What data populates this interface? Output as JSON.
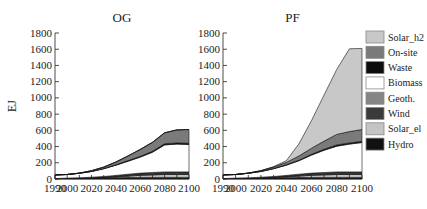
{
  "chart_data": [
    {
      "type": "area",
      "title": "OG",
      "xlabel": "",
      "ylabel": "EJ",
      "ylim": [
        0,
        1800
      ],
      "xlim": [
        1990,
        2100
      ],
      "x_ticks": [
        1990,
        2000,
        2020,
        2040,
        2060,
        2080,
        2100
      ],
      "y_ticks": [
        0,
        200,
        400,
        600,
        800,
        1000,
        1200,
        1400,
        1600,
        1800
      ],
      "stacked": true,
      "x": [
        1990,
        2000,
        2010,
        2020,
        2030,
        2040,
        2050,
        2060,
        2070,
        2080,
        2090,
        2100
      ],
      "series": [
        {
          "name": "Hydro",
          "values": [
            5,
            8,
            10,
            12,
            14,
            16,
            18,
            20,
            20,
            20,
            20,
            20
          ]
        },
        {
          "name": "Solar_el",
          "values": [
            0,
            0,
            0,
            1,
            4,
            10,
            18,
            25,
            30,
            35,
            35,
            35
          ]
        },
        {
          "name": "Wind",
          "values": [
            0,
            1,
            2,
            5,
            8,
            12,
            16,
            20,
            22,
            24,
            25,
            25
          ]
        },
        {
          "name": "Geoth.",
          "values": [
            1,
            2,
            3,
            4,
            5,
            6,
            7,
            8,
            8,
            8,
            8,
            8
          ]
        },
        {
          "name": "Biomass",
          "values": [
            44,
            45,
            55,
            70,
            95,
            126,
            161,
            197,
            250,
            333,
            342,
            337
          ]
        },
        {
          "name": "Waste",
          "values": [
            0,
            0,
            1,
            2,
            3,
            5,
            7,
            10,
            12,
            15,
            15,
            15
          ]
        },
        {
          "name": "On-site",
          "values": [
            0,
            0,
            2,
            8,
            18,
            35,
            58,
            85,
            110,
            135,
            160,
            170
          ]
        },
        {
          "name": "Solar_h2",
          "values": [
            0,
            0,
            0,
            0,
            0,
            0,
            0,
            0,
            0,
            0,
            0,
            0
          ]
        }
      ],
      "totals": [
        50,
        56,
        73,
        102,
        147,
        210,
        285,
        365,
        452,
        570,
        605,
        610
      ]
    },
    {
      "type": "area",
      "title": "PF",
      "xlabel": "",
      "ylabel": "",
      "ylim": [
        0,
        1800
      ],
      "xlim": [
        1990,
        2100
      ],
      "x_ticks": [
        1990,
        2000,
        2020,
        2040,
        2060,
        2080,
        2100
      ],
      "y_ticks": [
        0,
        200,
        400,
        600,
        800,
        1000,
        1200,
        1400,
        1600,
        1800
      ],
      "stacked": true,
      "x": [
        1990,
        2000,
        2010,
        2020,
        2030,
        2040,
        2050,
        2060,
        2070,
        2080,
        2090,
        2100
      ],
      "series": [
        {
          "name": "Hydro",
          "values": [
            5,
            8,
            10,
            12,
            14,
            16,
            18,
            20,
            20,
            20,
            20,
            20
          ]
        },
        {
          "name": "Solar_el",
          "values": [
            0,
            0,
            0,
            1,
            4,
            10,
            18,
            25,
            30,
            35,
            35,
            35
          ]
        },
        {
          "name": "Wind",
          "values": [
            0,
            1,
            2,
            5,
            8,
            12,
            16,
            20,
            22,
            24,
            25,
            25
          ]
        },
        {
          "name": "Geoth.",
          "values": [
            1,
            2,
            3,
            4,
            5,
            6,
            7,
            8,
            8,
            8,
            8,
            8
          ]
        },
        {
          "name": "Biomass",
          "values": [
            44,
            45,
            55,
            70,
            95,
            126,
            166,
            222,
            275,
            318,
            342,
            362
          ]
        },
        {
          "name": "Waste",
          "values": [
            0,
            0,
            1,
            2,
            3,
            5,
            7,
            10,
            12,
            15,
            15,
            15
          ]
        },
        {
          "name": "On-site",
          "values": [
            0,
            0,
            2,
            8,
            18,
            30,
            50,
            75,
            100,
            130,
            140,
            145
          ]
        },
        {
          "name": "Solar_h2",
          "values": [
            0,
            0,
            0,
            0,
            5,
            20,
            150,
            340,
            570,
            800,
            1020,
            1000
          ]
        }
      ],
      "totals": [
        50,
        56,
        73,
        102,
        152,
        225,
        432,
        720,
        1037,
        1350,
        1605,
        1610
      ]
    }
  ],
  "legend": {
    "position": "right",
    "items": [
      {
        "label": "Solar_h2",
        "color": "#c8c8c8"
      },
      {
        "label": "On-site",
        "color": "#7a7a7a"
      },
      {
        "label": "Waste",
        "color": "#0d0d0d"
      },
      {
        "label": "Biomass",
        "color": "#ffffff"
      },
      {
        "label": "Geoth.",
        "color": "#858585"
      },
      {
        "label": "Wind",
        "color": "#3a3a3a"
      },
      {
        "label": "Solar_el",
        "color": "#c4c4c4"
      },
      {
        "label": "Hydro",
        "color": "#111111"
      }
    ]
  },
  "panels": {
    "left": {
      "title": "OG",
      "ylabel": "EJ"
    },
    "right": {
      "title": "PF"
    }
  }
}
